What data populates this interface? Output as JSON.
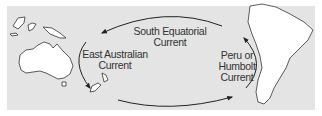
{
  "diagram": {
    "type": "ocean-currents-map",
    "labels": {
      "south_equatorial": [
        "South Equatorial",
        "Current"
      ],
      "east_australian": [
        "East Australian",
        "Current"
      ],
      "peru_humbolt": [
        "Peru or",
        "Humbolt",
        "Current"
      ]
    },
    "landmasses": [
      "Australia",
      "New Guinea",
      "New Zealand",
      "South America"
    ],
    "colors": {
      "ocean": "#e4e4e4",
      "land": "#ffffff",
      "outline": "#333333",
      "arrow": "#222222"
    }
  }
}
